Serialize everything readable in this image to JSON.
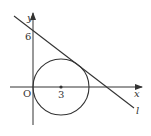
{
  "diagram": {
    "axes": {
      "x_label": "x",
      "y_label": "y",
      "origin_label": "O"
    },
    "ticks": {
      "y_tick": "6",
      "x_tick": "3"
    },
    "circle": {
      "center": [
        3,
        0
      ],
      "radius": 3
    },
    "line": {
      "label": "l",
      "y_intercept": 6,
      "tangent_to_circle": true
    },
    "colors": {
      "stroke": "#333333",
      "background": "#ffffff"
    }
  }
}
